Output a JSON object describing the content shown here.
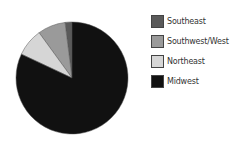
{
  "chart_data": {
    "type": "pie",
    "title": "",
    "categories": [
      "Southeast",
      "Southwest/West",
      "Northeast",
      "Midwest"
    ],
    "values": [
      2,
      8,
      8,
      82
    ],
    "colors": [
      "#5a5a5a",
      "#9a9a9a",
      "#d6d6d6",
      "#111111"
    ],
    "start_angle": "12 o'clock",
    "direction": "counter-clockwise",
    "legend_position": "right"
  },
  "legend": {
    "items": [
      {
        "label": "Southeast",
        "color": "#5a5a5a"
      },
      {
        "label": "Southwest/West",
        "color": "#9a9a9a"
      },
      {
        "label": "Northeast",
        "color": "#d6d6d6"
      },
      {
        "label": "Midwest",
        "color": "#111111"
      }
    ]
  }
}
